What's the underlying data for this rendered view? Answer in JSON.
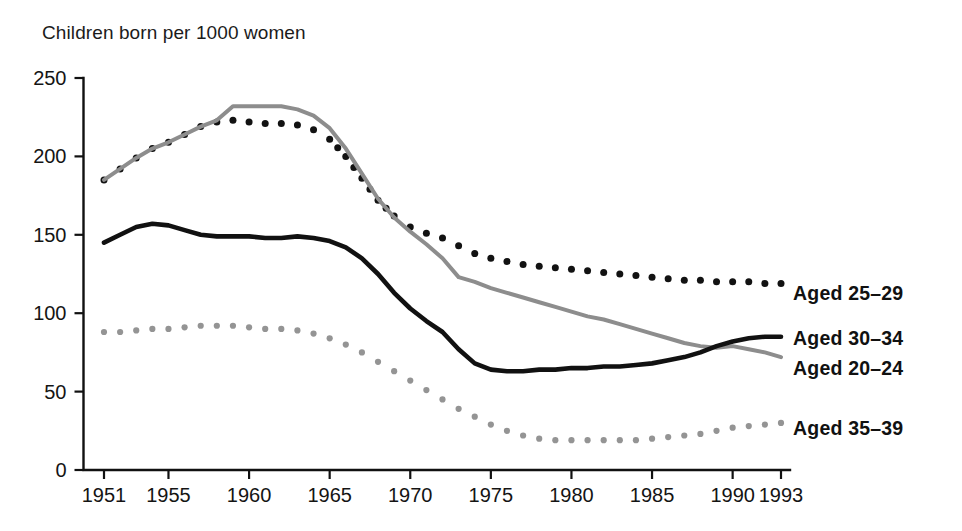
{
  "chart_data": {
    "type": "line",
    "title": "Children born per 1000 women",
    "xlabel": "",
    "ylabel": "Children born per 1000 women",
    "xlim": [
      1951,
      1993
    ],
    "ylim": [
      0,
      250
    ],
    "yticks": [
      0,
      50,
      100,
      150,
      200,
      250
    ],
    "xticks": [
      1951,
      1955,
      1960,
      1965,
      1970,
      1975,
      1980,
      1985,
      1990,
      1993
    ],
    "grid": false,
    "legend_position": "right-of-plot-at-line-ends",
    "x": [
      1951,
      1952,
      1953,
      1954,
      1955,
      1956,
      1957,
      1958,
      1959,
      1960,
      1961,
      1962,
      1963,
      1964,
      1965,
      1966,
      1967,
      1968,
      1969,
      1970,
      1971,
      1972,
      1973,
      1974,
      1975,
      1976,
      1977,
      1978,
      1979,
      1980,
      1981,
      1982,
      1983,
      1984,
      1985,
      1986,
      1987,
      1988,
      1989,
      1990,
      1991,
      1992,
      1993
    ],
    "series": [
      {
        "name": "Aged 25-29",
        "label": "Aged 25–29",
        "style": "dotted",
        "color": "#121212",
        "values": [
          185,
          192,
          199,
          205,
          209,
          214,
          219,
          222,
          223,
          222,
          221,
          221,
          220,
          217,
          211,
          200,
          186,
          172,
          162,
          155,
          151,
          148,
          143,
          138,
          135,
          133,
          131,
          130,
          129,
          128,
          127,
          126,
          125,
          124,
          123,
          122,
          121,
          121,
          120,
          120,
          120,
          119,
          119
        ]
      },
      {
        "name": "Aged 20-24",
        "label": "Aged 20–24",
        "style": "solid",
        "color": "#8d8d8d",
        "values": [
          185,
          192,
          199,
          205,
          209,
          214,
          219,
          223,
          232,
          232,
          232,
          232,
          230,
          226,
          218,
          205,
          189,
          173,
          161,
          152,
          144,
          135,
          123,
          120,
          116,
          113,
          110,
          107,
          104,
          101,
          98,
          96,
          93,
          90,
          87,
          84,
          81,
          79,
          78,
          79,
          77,
          75,
          72
        ]
      },
      {
        "name": "Aged 30-34",
        "label": "Aged 30–34",
        "style": "solid",
        "color": "#111111",
        "values": [
          145,
          150,
          155,
          157,
          156,
          153,
          150,
          149,
          149,
          149,
          148,
          148,
          149,
          148,
          146,
          142,
          135,
          125,
          113,
          103,
          95,
          88,
          77,
          68,
          64,
          63,
          63,
          64,
          64,
          65,
          65,
          66,
          66,
          67,
          68,
          70,
          72,
          75,
          79,
          82,
          84,
          85,
          85
        ]
      },
      {
        "name": "Aged 35-39",
        "label": "Aged 35–39",
        "style": "dotted",
        "color": "#949494",
        "values": [
          88,
          88,
          89,
          90,
          90,
          91,
          92,
          92,
          92,
          91,
          90,
          90,
          89,
          87,
          84,
          80,
          75,
          69,
          63,
          57,
          51,
          45,
          39,
          34,
          29,
          25,
          22,
          20,
          19,
          19,
          19,
          19,
          19,
          19,
          20,
          21,
          22,
          23,
          25,
          27,
          28,
          29,
          30
        ]
      }
    ]
  }
}
